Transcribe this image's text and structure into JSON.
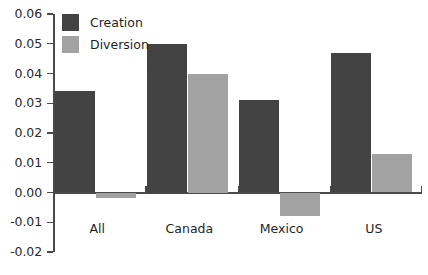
{
  "chart_data": {
    "type": "bar",
    "title": "",
    "subtitle": "",
    "xlabel": "",
    "ylabel": "",
    "categories": [
      "All",
      "Canada",
      "Mexico",
      "US"
    ],
    "series": [
      {
        "name": "Creation",
        "color": "#434343",
        "values": [
          0.034,
          0.05,
          0.031,
          0.047
        ]
      },
      {
        "name": "Diversion",
        "color": "#a2a2a2",
        "values": [
          -0.002,
          0.04,
          -0.008,
          0.013
        ]
      }
    ],
    "ylim": [
      -0.02,
      0.06
    ],
    "yticks": [
      0.06,
      0.05,
      0.04,
      0.03,
      0.02,
      0.01,
      0.0,
      -0.01,
      -0.02
    ],
    "ytick_labels": [
      "0.06",
      "0.05",
      "0.04",
      "0.03",
      "0.02",
      "0.01",
      "0.00",
      "-0.01",
      "-0.02"
    ],
    "grid": false,
    "legend_position": "top-left",
    "legend_entries": [
      "Creation",
      "Diversion"
    ],
    "zero_line": 0.0,
    "axis_color": "#4a4a4a",
    "background_color": "#ffffff"
  },
  "legend": {
    "creation_label": "Creation",
    "diversion_label": "Diversion"
  },
  "axis": {
    "y_labels": [
      "0.06",
      "0.05",
      "0.04",
      "0.03",
      "0.02",
      "0.01",
      "0.00",
      "-0.01",
      "-0.02"
    ],
    "x_labels": [
      "All",
      "Canada",
      "Mexico",
      "US"
    ]
  }
}
